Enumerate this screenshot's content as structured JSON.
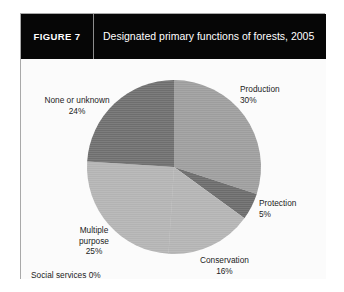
{
  "figure": {
    "number_label": "FIGURE 7",
    "title": "Designated primary functions of forests, 2005"
  },
  "colors": {
    "header_background": "#060606",
    "header_text": "#ffffff",
    "frame_border": "#a9a9a9",
    "page_background": "#fbfbfb",
    "slice_production": "#9d9d9d",
    "slice_protection": "#6b6b6b",
    "slice_conservation": "#b3b3b3",
    "slice_multiple_purpose": "#b3b3b3",
    "slice_social_services": "#b3b3b3",
    "slice_none_or_unknown": "#6e6e6e",
    "label_text": "#1c1c1c"
  },
  "labels": {
    "production": {
      "name": "Production",
      "percent": "30%"
    },
    "protection": {
      "name": "Protection",
      "percent": "5%"
    },
    "conservation": {
      "name": "Conservation",
      "percent": "16%"
    },
    "multiple_purpose_line1": "Multiple",
    "multiple_purpose_line2": "purpose",
    "multiple_purpose_percent": "25%",
    "none_or_unknown": {
      "name": "None or unknown",
      "percent": "24%"
    },
    "social_services": "Social services 0%"
  },
  "chart_data": {
    "type": "pie",
    "title": "Designated primary functions of forests, 2005",
    "subtitle": "",
    "xlabel": "",
    "ylabel": "",
    "legend_position": "none",
    "labels_inline": true,
    "grid": false,
    "categories": [
      "Production",
      "Protection",
      "Conservation",
      "Social services",
      "Multiple purpose",
      "None or unknown"
    ],
    "values": [
      30,
      5,
      16,
      0,
      25,
      24
    ],
    "value_labels": [
      "30%",
      "5%",
      "16%",
      "0%",
      "25%",
      "24%"
    ],
    "units": "percent",
    "total": 100,
    "start_angle_deg": 0,
    "direction": "clockwise",
    "slice_colors": [
      "#9d9d9d",
      "#6b6b6b",
      "#b3b3b3",
      "#b3b3b3",
      "#b3b3b3",
      "#6e6e6e"
    ],
    "annotations": []
  }
}
